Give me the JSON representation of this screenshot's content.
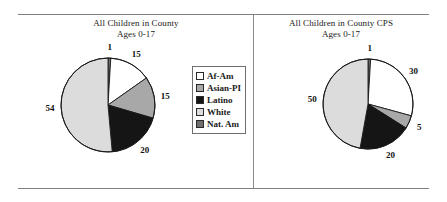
{
  "figure": {
    "divider": true,
    "rules": [
      "top-rule",
      "bottom-rule"
    ]
  },
  "colors": {
    "af_am": "#ffffff",
    "asian_pi": "#a8a8a8",
    "latino": "#151515",
    "white": "#dcdcdc",
    "nat_am": "#6f6f6f",
    "outline": "#1a1a1a",
    "rule": "#808080"
  },
  "legend": {
    "items": [
      {
        "label": "Af-Am",
        "color": "#ffffff"
      },
      {
        "label": "Asian-PI",
        "color": "#a8a8a8"
      },
      {
        "label": "Latino",
        "color": "#151515"
      },
      {
        "label": "White",
        "color": "#dcdcdc"
      },
      {
        "label": "Nat. Am",
        "color": "#6f6f6f"
      }
    ]
  },
  "panels": [
    {
      "title_line1": "All Children in County",
      "title_line2": "Ages 0-17"
    },
    {
      "title_line1": "All Children in County CPS",
      "title_line2": "Ages 0-17"
    }
  ],
  "chart_data": [
    {
      "type": "pie",
      "title": "All Children in County Ages 0-17",
      "categories": [
        "Nat. Am",
        "Af-Am",
        "Asian-PI",
        "Latino",
        "White"
      ],
      "values": [
        1,
        15,
        15,
        20,
        54
      ],
      "labels": [
        "1",
        "15",
        "15",
        "20",
        "54"
      ],
      "colors": [
        "#6f6f6f",
        "#ffffff",
        "#a8a8a8",
        "#151515",
        "#dcdcdc"
      ],
      "units": "percent",
      "start_angle_deg": 0,
      "direction": "clockwise",
      "legend_position": "right"
    },
    {
      "type": "pie",
      "title": "All Children in County CPS Ages 0-17",
      "categories": [
        "Nat. Am",
        "Af-Am",
        "Asian-PI",
        "Latino",
        "White"
      ],
      "values": [
        1,
        30,
        5,
        20,
        50
      ],
      "labels": [
        "1",
        "30",
        "5",
        "20",
        "50"
      ],
      "colors": [
        "#6f6f6f",
        "#ffffff",
        "#a8a8a8",
        "#151515",
        "#dcdcdc"
      ],
      "units": "percent",
      "start_angle_deg": 0,
      "direction": "clockwise",
      "legend_position": "none"
    }
  ],
  "geometry": [
    {
      "cx": 89,
      "cy": 90,
      "r": 47,
      "label_r": 58
    },
    {
      "cx": 114,
      "cy": 89,
      "r": 45,
      "label_r": 56
    }
  ]
}
